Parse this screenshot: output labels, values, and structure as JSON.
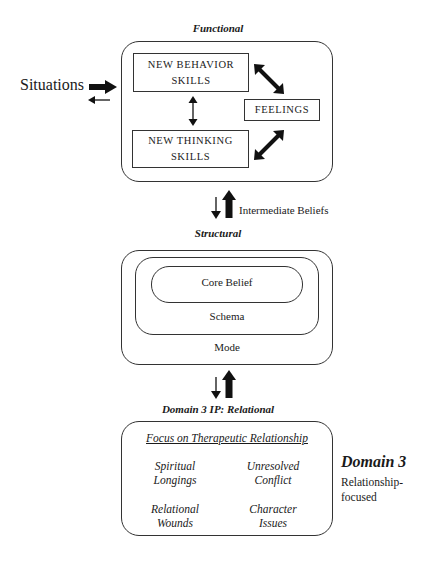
{
  "functional": {
    "title": "Functional",
    "situations_label": "Situations",
    "behavior_box": {
      "line1": "NEW BEHAVIOR",
      "line2": "SKILLS"
    },
    "thinking_box": {
      "line1": "NEW THINKING",
      "line2": "SKILLS"
    },
    "feelings_box": "FEELINGS"
  },
  "connector_1": {
    "label": "Intermediate Beliefs"
  },
  "structural": {
    "title": "Structural",
    "core_belief": "Core Belief",
    "schema": "Schema",
    "mode": "Mode"
  },
  "relational": {
    "title": "Domain 3 IP: Relational",
    "heading": "Focus on Therapeutic Relationship",
    "items": [
      {
        "line1": "Spiritual",
        "line2": "Longings"
      },
      {
        "line1": "Unresolved",
        "line2": "Conflict"
      },
      {
        "line1": "Relational",
        "line2": "Wounds"
      },
      {
        "line1": "Character",
        "line2": "Issues"
      }
    ]
  },
  "side_note": {
    "title": "Domain 3",
    "line1": "Relationship-",
    "line2": "focused"
  }
}
